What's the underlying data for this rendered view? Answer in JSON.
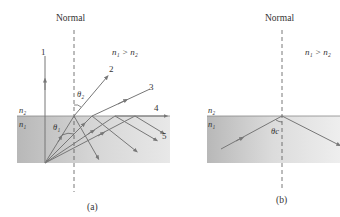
{
  "panel_a": {
    "normal_label": "Normal",
    "condition": "n₁ > n₂",
    "n2_label": "n₂",
    "n1_label": "n₁",
    "theta1_label": "θ₁",
    "theta2_label": "θ₂",
    "ray_labels": [
      "1",
      "2",
      "3",
      "4",
      "5"
    ],
    "caption": "(a)"
  },
  "panel_b": {
    "normal_label": "Normal",
    "condition": "n₁ > n₂",
    "n2_label": "n₂",
    "n1_label": "n₁",
    "thetac_label": "θc",
    "caption": "(b)"
  },
  "colors": {
    "medium_fill_left": "#bdbdbd",
    "medium_fill_right": "#e6e6e6",
    "ray": "#777777",
    "normal": "#555555"
  }
}
